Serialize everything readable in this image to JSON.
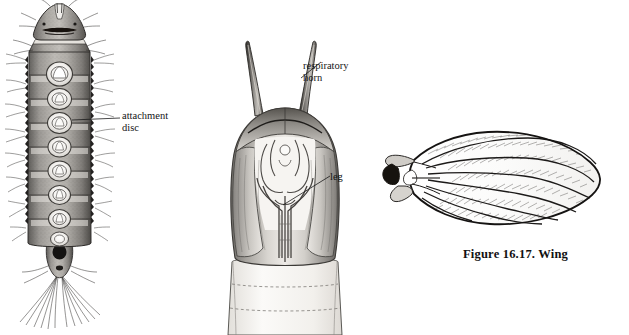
{
  "plate": {
    "background": "#ffffff",
    "ink": "#1a1a1a",
    "caption": "Figure 16.17.  Wing",
    "figures": [
      {
        "id": "larva",
        "name": "larva-dorsal-view",
        "description": "Dorsal view of aquatic fly larva with segmented body, lateral bristle tufts and caudal bristle fan"
      },
      {
        "id": "pupa",
        "name": "pupa-ventral-view",
        "description": "Pupa showing paired respiratory horns, wing pads and leg cases"
      },
      {
        "id": "wing",
        "name": "wing-venation",
        "description": "Hairy lanceolate wing with longitudinal veins and dense setae"
      }
    ],
    "labels": [
      {
        "id": "attachment-disc",
        "text": "attachment\ndisc",
        "x": 122,
        "y": 113
      },
      {
        "id": "respiratory-horn",
        "text": "respiratory\nhorn",
        "x": 303,
        "y": 63
      },
      {
        "id": "leg",
        "text": "leg",
        "x": 330,
        "y": 175
      }
    ]
  }
}
